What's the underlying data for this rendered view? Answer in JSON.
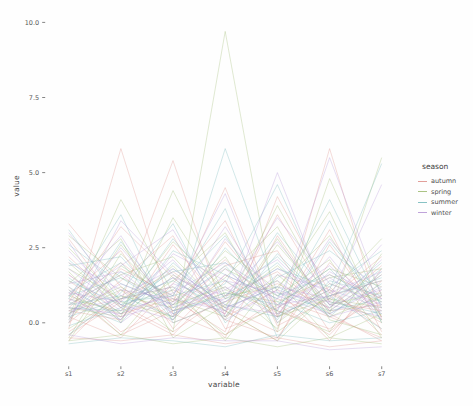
{
  "chart_data": {
    "type": "line",
    "variant": "parallel-coordinates",
    "title": "",
    "xlabel": "variable",
    "ylabel": "value",
    "categories": [
      "s1",
      "s2",
      "s3",
      "s4",
      "s5",
      "s6",
      "s7"
    ],
    "yticks": [
      0.0,
      2.5,
      5.0,
      7.5,
      10.0
    ],
    "ylim": [
      -1.4,
      10.5
    ],
    "grid": false,
    "legend_title": "season",
    "legend_position": "right",
    "series": [
      {
        "name": "autumn",
        "color": "#dd8e88",
        "lines": [
          [
            -0.2,
            5.8,
            0.3,
            -0.4,
            0.8,
            0.2,
            -0.5
          ],
          [
            0.4,
            0.1,
            2.6,
            0.5,
            -0.3,
            5.8,
            0.1
          ],
          [
            1.2,
            -0.3,
            0.6,
            2.1,
            0.4,
            -0.2,
            0.9
          ],
          [
            2.8,
            0.5,
            -0.4,
            1.4,
            0.2,
            3.1,
            -0.3
          ],
          [
            0.1,
            1.8,
            0.9,
            -0.5,
            2.9,
            0.4,
            0.6
          ],
          [
            -0.4,
            0.7,
            5.4,
            0.2,
            1.1,
            -0.6,
            1.8
          ],
          [
            0.9,
            2.4,
            -0.2,
            1.6,
            0.3,
            1.2,
            -0.4
          ],
          [
            0.2,
            -0.5,
            1.3,
            3.4,
            -0.1,
            0.8,
            2.2
          ],
          [
            1.6,
            0.3,
            0.8,
            -0.3,
            4.2,
            1.0,
            0.0
          ],
          [
            -0.6,
            1.1,
            0.2,
            2.7,
            0.6,
            -0.4,
            1.4
          ],
          [
            0.7,
            3.2,
            1.5,
            0.1,
            -0.5,
            2.0,
            0.5
          ],
          [
            2.2,
            0.6,
            -0.3,
            0.9,
            1.7,
            0.3,
            -0.6
          ],
          [
            0.0,
            1.4,
            2.9,
            -0.2,
            0.5,
            1.6,
            0.8
          ],
          [
            1.0,
            -0.4,
            0.4,
            1.9,
            2.4,
            -0.3,
            1.1
          ],
          [
            -0.3,
            0.8,
            1.7,
            0.4,
            -0.6,
            2.6,
            0.2
          ],
          [
            3.3,
            1.2,
            0.0,
            0.7,
            1.3,
            0.5,
            1.9
          ],
          [
            0.5,
            2.0,
            0.7,
            4.5,
            0.2,
            1.1,
            -0.2
          ],
          [
            1.4,
            0.2,
            1.1,
            0.3,
            3.6,
            0.7,
            0.4
          ],
          [
            -0.5,
            -0.6,
            -0.4,
            -0.7,
            -0.5,
            -0.8,
            -0.6
          ]
        ]
      },
      {
        "name": "spring",
        "color": "#9cb96f",
        "lines": [
          [
            0.3,
            1.1,
            -0.3,
            9.7,
            0.2,
            0.8,
            0.1
          ],
          [
            0.8,
            0.4,
            1.9,
            0.1,
            2.8,
            0.3,
            5.5
          ],
          [
            -0.5,
            2.3,
            0.6,
            1.2,
            -0.2,
            4.8,
            0.9
          ],
          [
            1.7,
            0.0,
            3.5,
            0.8,
            1.4,
            -0.5,
            0.3
          ],
          [
            0.2,
            4.1,
            1.0,
            -0.4,
            0.6,
            1.8,
            1.2
          ],
          [
            2.5,
            0.7,
            0.2,
            1.5,
            3.2,
            0.1,
            -0.4
          ],
          [
            0.6,
            1.6,
            2.2,
            0.4,
            -0.6,
            1.0,
            2.8
          ],
          [
            -0.2,
            0.9,
            0.5,
            2.4,
            1.1,
            3.7,
            0.0
          ],
          [
            1.3,
            2.8,
            -0.5,
            0.6,
            1.9,
            0.4,
            1.6
          ],
          [
            0.9,
            0.3,
            1.4,
            3.0,
            0.0,
            1.3,
            0.7
          ],
          [
            -0.6,
            1.9,
            0.8,
            0.2,
            2.6,
            0.6,
            1.0
          ],
          [
            2.0,
            0.5,
            2.7,
            1.1,
            0.4,
            -0.3,
            2.3
          ],
          [
            0.4,
            1.2,
            0.1,
            1.8,
            0.9,
            2.1,
            -0.5
          ],
          [
            1.1,
            -0.4,
            1.6,
            0.5,
            3.9,
            0.8,
            0.5
          ],
          [
            0.0,
            2.6,
            0.4,
            1.0,
            0.7,
            1.5,
            1.8
          ],
          [
            1.8,
            0.8,
            1.2,
            -0.6,
            1.6,
            0.2,
            0.9
          ],
          [
            0.5,
            0.2,
            4.4,
            0.9,
            1.2,
            2.9,
            0.2
          ],
          [
            2.9,
            1.5,
            0.7,
            2.2,
            -0.3,
            0.9,
            1.4
          ],
          [
            -0.6,
            -0.4,
            -0.7,
            -0.5,
            -0.8,
            -0.5,
            -0.7
          ]
        ]
      },
      {
        "name": "summer",
        "color": "#72b7ba",
        "lines": [
          [
            0.6,
            0.9,
            0.2,
            5.8,
            1.0,
            0.4,
            0.8
          ],
          [
            1.5,
            0.3,
            1.8,
            0.6,
            0.2,
            1.1,
            5.3
          ],
          [
            0.1,
            2.7,
            0.5,
            1.3,
            4.6,
            0.7,
            0.3
          ],
          [
            -0.4,
            1.0,
            3.3,
            0.0,
            1.5,
            2.4,
            1.1
          ],
          [
            2.1,
            0.6,
            1.1,
            2.9,
            0.3,
            0.9,
            -0.2
          ],
          [
            0.8,
            3.6,
            0.0,
            0.7,
            2.0,
            0.2,
            1.7
          ],
          [
            1.2,
            0.1,
            2.4,
            1.6,
            0.8,
            4.1,
            0.5
          ],
          [
            0.3,
            1.7,
            0.9,
            3.8,
            -0.5,
            1.4,
            0.9
          ],
          [
            -0.1,
            0.5,
            1.5,
            0.2,
            2.3,
            0.6,
            2.0
          ],
          [
            1.9,
            2.2,
            0.3,
            1.0,
            0.6,
            1.8,
            0.1
          ],
          [
            0.7,
            0.0,
            2.0,
            0.5,
            1.2,
            0.3,
            1.3
          ],
          [
            2.6,
            1.3,
            0.6,
            1.9,
            0.1,
            2.7,
            0.6
          ],
          [
            0.2,
            0.8,
            1.4,
            0.4,
            3.0,
            0.9,
            1.5
          ],
          [
            1.0,
            2.0,
            0.1,
            2.5,
            0.7,
            0.0,
            0.4
          ],
          [
            0.5,
            0.4,
            2.8,
            0.8,
            1.8,
            1.2,
            2.4
          ],
          [
            3.1,
            0.7,
            0.9,
            1.4,
            0.4,
            3.4,
            0.0
          ],
          [
            0.9,
            1.5,
            0.4,
            0.9,
            2.2,
            0.5,
            1.8
          ],
          [
            1.4,
            0.6,
            1.7,
            2.0,
            0.9,
            1.6,
            0.7
          ],
          [
            -0.7,
            -0.5,
            -0.6,
            -0.8,
            -0.4,
            -0.6,
            -0.5
          ]
        ]
      },
      {
        "name": "winter",
        "color": "#b493d4",
        "lines": [
          [
            0.4,
            0.8,
            1.2,
            0.3,
            5.0,
            0.6,
            0.2
          ],
          [
            1.1,
            0.2,
            0.7,
            1.8,
            0.4,
            5.5,
            0.9
          ],
          [
            0.0,
            3.4,
            1.6,
            0.5,
            1.2,
            0.8,
            4.6
          ],
          [
            2.4,
            0.6,
            0.1,
            2.8,
            0.9,
            0.3,
            1.2
          ],
          [
            0.7,
            1.9,
            3.1,
            0.2,
            1.6,
            1.1,
            0.5
          ],
          [
            1.6,
            0.4,
            0.9,
            4.3,
            0.0,
            1.7,
            0.8
          ],
          [
            0.2,
            2.5,
            0.5,
            1.1,
            2.1,
            0.4,
            1.6
          ],
          [
            3.0,
            0.9,
            1.8,
            0.6,
            0.3,
            2.2,
            0.1
          ],
          [
            0.8,
            0.1,
            2.3,
            1.4,
            1.0,
            0.7,
            2.6
          ],
          [
            1.3,
            1.7,
            0.4,
            0.8,
            3.5,
            1.3,
            0.6
          ],
          [
            0.5,
            0.3,
            1.0,
            2.0,
            0.6,
            0.9,
            1.4
          ],
          [
            2.0,
            1.1,
            0.8,
            0.4,
            1.4,
            0.2,
            0.7
          ],
          [
            0.9,
            2.9,
            0.2,
            1.6,
            0.8,
            1.9,
            0.3
          ],
          [
            1.8,
            0.5,
            1.5,
            0.9,
            2.7,
            0.6,
            1.1
          ],
          [
            0.3,
            1.3,
            0.6,
            3.2,
            0.5,
            1.5,
            0.4
          ],
          [
            1.0,
            0.7,
            2.1,
            0.1,
            1.1,
            0.5,
            2.1
          ],
          [
            0.6,
            1.6,
            0.3,
            1.2,
            0.2,
            2.8,
            0.8
          ],
          [
            2.7,
            0.0,
            1.3,
            0.7,
            1.8,
            1.0,
            1.7
          ],
          [
            -0.4,
            -0.7,
            -0.5,
            -0.6,
            -0.6,
            -0.9,
            -0.8
          ]
        ]
      }
    ]
  }
}
